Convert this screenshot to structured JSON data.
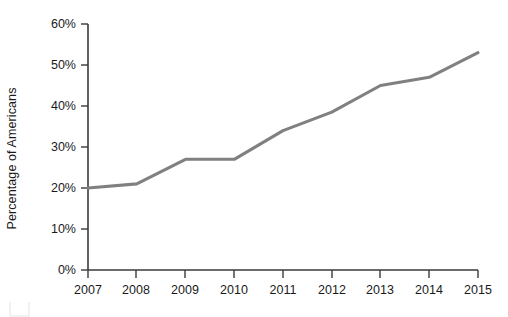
{
  "chart_data": {
    "type": "line",
    "title": "",
    "subtitle": "",
    "xlabel": "",
    "ylabel": "Percentage of Americans",
    "categories": [
      "2007",
      "2008",
      "2009",
      "2010",
      "2011",
      "2012",
      "2013",
      "2014",
      "2015"
    ],
    "x": [
      2007,
      2008,
      2009,
      2010,
      2011,
      2012,
      2013,
      2014,
      2015
    ],
    "values": [
      20,
      21,
      27,
      27,
      34,
      38.5,
      45,
      47,
      53
    ],
    "value_labels": [
      "20%",
      "21%",
      "27%",
      "27%",
      "34%",
      "38.5%",
      "45%",
      "47%",
      "53%"
    ],
    "ylim": [
      0,
      60
    ],
    "xlim": [
      2007,
      2015
    ],
    "ytick_values": [
      0,
      10,
      20,
      30,
      40,
      50,
      60
    ],
    "ytick_labels": [
      "0%",
      "10%",
      "20%",
      "30%",
      "40%",
      "50%",
      "60%"
    ],
    "xtick_labels": [
      "2007",
      "2008",
      "2009",
      "2010",
      "2011",
      "2012",
      "2013",
      "2014",
      "2015"
    ],
    "grid": false,
    "legend": false,
    "legend_position": "none",
    "series": [
      {
        "name": "Percentage of Americans",
        "values": [
          20,
          21,
          27,
          27,
          34,
          38.5,
          45,
          47,
          53
        ],
        "color": "#808080"
      }
    ],
    "annotations": []
  },
  "colors": {
    "line": "#808080",
    "axis": "#3a3a3a",
    "text": "#1a1a1a",
    "background": "#ffffff",
    "artifact": "#f1f1f1"
  },
  "geometry": {
    "plot_left": 88,
    "plot_right": 478,
    "plot_top": 24,
    "plot_bottom": 270
  }
}
